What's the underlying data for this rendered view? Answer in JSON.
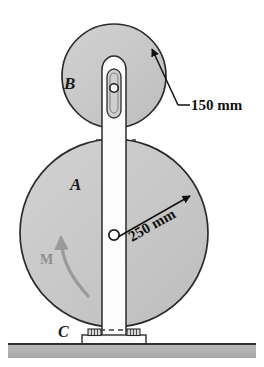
{
  "figure": {
    "type": "engineering-mechanics-diagram",
    "background_color": "#ffffff",
    "disk_fill_color": "#c8c8c8",
    "disk_stroke_color": "#2b2b2b",
    "bar_fill_color": "#fdfdfd",
    "ground_fill_color": "#b0b0b0",
    "ground_line_color": "#303030",
    "moment_arrow_color": "#9a9a9a",
    "dimension_line_color": "#111111"
  },
  "labels": {
    "disk_b": "B",
    "disk_a": "A",
    "support_c": "C",
    "moment": "M"
  },
  "dimensions": [
    {
      "id": "radius-b",
      "text": "150 mm",
      "value": 150,
      "unit": "mm",
      "applies_to": "B"
    },
    {
      "id": "radius-a",
      "text": "250 mm",
      "value": 250,
      "unit": "mm",
      "applies_to": "A"
    }
  ],
  "geometry": {
    "disk_b": {
      "cx": 114,
      "cy": 76,
      "r": 52
    },
    "disk_a": {
      "cx": 114,
      "cy": 233,
      "r": 94
    },
    "pin_b": {
      "cx": 114,
      "cy": 88,
      "r": 4
    },
    "pin_a": {
      "cx": 114,
      "cy": 235,
      "r": 5
    },
    "bar": {
      "x": 102,
      "width": 30,
      "top": 55,
      "bottom": 338
    },
    "ground": {
      "y": 344,
      "height": 14
    }
  }
}
